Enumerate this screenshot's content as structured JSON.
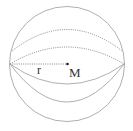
{
  "diagram": {
    "type": "sphere",
    "labels": {
      "radius": "r",
      "center": "M"
    },
    "colors": {
      "stroke": "#8a8a8a",
      "dotted": "#7a7a7a",
      "text": "#333333"
    }
  }
}
